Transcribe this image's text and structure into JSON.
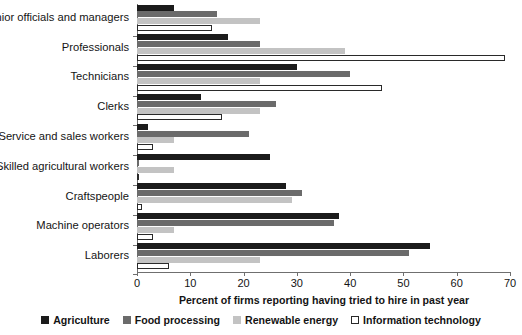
{
  "chart_data": {
    "type": "bar",
    "orientation": "horizontal",
    "title": "",
    "xlabel": "Percent of firms reporting having tried to hire in past year",
    "ylabel": "",
    "xlim": [
      0,
      70
    ],
    "xticks": [
      0,
      10,
      20,
      30,
      40,
      50,
      60,
      70
    ],
    "grid": false,
    "legend_position": "bottom",
    "categories": [
      "Senior officials and managers",
      "Professionals",
      "Technicians",
      "Clerks",
      "Service and sales workers",
      "Skilled agricultural workers",
      "Craftspeople",
      "Machine operators",
      "Laborers"
    ],
    "series": [
      {
        "name": "Agriculture",
        "color": "#1b1b1b",
        "values": [
          7,
          17,
          30,
          12,
          2,
          25,
          28,
          38,
          55
        ]
      },
      {
        "name": "Food processing",
        "color": "#6b6b6b",
        "values": [
          15,
          23,
          40,
          26,
          21,
          0.3,
          31,
          37,
          51
        ]
      },
      {
        "name": "Renewable energy",
        "color": "#c3c3c3",
        "values": [
          23,
          39,
          23,
          23,
          7,
          7,
          29,
          7,
          23
        ]
      },
      {
        "name": "Information technology",
        "color": "#ffffff",
        "values": [
          14,
          69,
          46,
          16,
          3,
          0.4,
          1,
          3,
          6
        ]
      }
    ]
  },
  "axis": {
    "tick_labels": [
      "0",
      "10",
      "20",
      "30",
      "40",
      "50",
      "60",
      "70"
    ],
    "title": "Percent of firms reporting having tried to hire in past year"
  },
  "legend": {
    "items": [
      {
        "label": "Agriculture",
        "swatch": "filled-black-swatch"
      },
      {
        "label": "Food processing",
        "swatch": "filled-darkgray-swatch"
      },
      {
        "label": "Renewable energy",
        "swatch": "filled-lightgray-swatch"
      },
      {
        "label": "Information technology",
        "swatch": "outlined-white-swatch"
      }
    ]
  }
}
